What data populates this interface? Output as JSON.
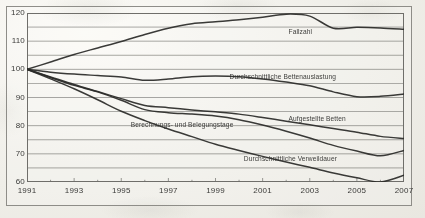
{
  "figure": {
    "background_color": "#efeee8",
    "line_color": "#2b2b29",
    "axis_color": "#6f6e6a",
    "frame_color": "#8e8d88"
  },
  "chart_data": {
    "type": "line",
    "title": "",
    "subtitle": "",
    "xlabel": "",
    "ylabel": "",
    "grid": true,
    "legend_position": "inline-labels",
    "x": [
      1991,
      1992,
      1993,
      1994,
      1995,
      1996,
      1997,
      1998,
      1999,
      2000,
      2001,
      2002,
      2003,
      2004,
      2005,
      2006,
      2007
    ],
    "xlim": [
      1991,
      2007
    ],
    "ylim": [
      60,
      120
    ],
    "yticks": [
      60,
      70,
      80,
      90,
      100,
      110,
      120
    ],
    "yticks_minor": [
      65,
      75,
      85,
      95,
      105,
      115
    ],
    "xticks": [
      1991,
      1993,
      1995,
      1997,
      1999,
      2001,
      2003,
      2005,
      2007
    ],
    "xtick_labels": [
      "1991",
      "1993",
      "1995",
      "1997",
      "1999",
      "2001",
      "2003",
      "2005",
      "2007"
    ],
    "ytick_labels": [
      "60",
      "70",
      "80",
      "90",
      "100",
      "110",
      "120"
    ],
    "series": [
      {
        "name": "Fallzahl",
        "label": "Fallzahl",
        "label_x": 2002.1,
        "label_y": 113.2,
        "values": [
          100.0,
          102.6,
          105.3,
          107.6,
          109.9,
          112.4,
          114.6,
          116.2,
          116.9,
          117.6,
          118.5,
          119.6,
          118.9,
          114.6,
          114.9,
          114.7,
          114.2
        ]
      },
      {
        "name": "Durchschnittliche Bettenauslastung",
        "label": "Durchschnittliche Bettenauslastung",
        "label_x": 1999.6,
        "label_y": 97.2,
        "values": [
          100.0,
          99.0,
          98.3,
          97.8,
          97.3,
          96.1,
          96.6,
          97.4,
          97.6,
          97.4,
          96.6,
          95.5,
          94.2,
          92.0,
          90.3,
          90.4,
          91.2
        ]
      },
      {
        "name": "Aufgestellte Betten",
        "label": "Aufgestellte Betten",
        "label_x": 2002.1,
        "label_y": 82.4,
        "values": [
          100.0,
          97.3,
          94.6,
          92.1,
          89.6,
          87.2,
          86.4,
          85.6,
          84.9,
          84.1,
          82.9,
          81.6,
          80.3,
          79.0,
          77.7,
          76.2,
          75.4
        ]
      },
      {
        "name": "Berechnungs- und Belegungstage",
        "label": "Berechnungs- und Belegungstage",
        "label_x": 1995.4,
        "label_y": 80.2,
        "values": [
          100.0,
          97.1,
          94.3,
          92.0,
          89.0,
          85.7,
          84.6,
          84.1,
          83.4,
          82.1,
          80.2,
          78.0,
          75.6,
          73.0,
          71.0,
          69.3,
          71.2
        ]
      },
      {
        "name": "Durchschnittliche Verweildauer",
        "label": "Durchschnittliche Verweildauer",
        "label_x": 2000.2,
        "label_y": 68.2,
        "values": [
          100.0,
          96.6,
          93.1,
          89.2,
          85.1,
          81.8,
          78.8,
          76.1,
          73.4,
          71.2,
          69.1,
          67.1,
          65.2,
          63.2,
          61.5,
          60.0,
          62.4
        ]
      }
    ]
  }
}
